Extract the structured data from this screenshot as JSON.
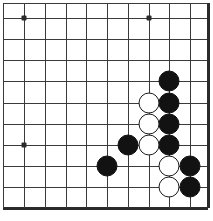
{
  "figure": {
    "kind": "go-board-diagram",
    "title": "",
    "caption": "",
    "corner": "bottom-left"
  },
  "board": {
    "background_color": "#ffffff",
    "line_color": "#3a3a3a",
    "edge_color": "#2b2b2b",
    "black_color": "#121212",
    "white_color": "#ffffff",
    "white_outline_color": "#1a1a1a",
    "spacing_px": 20.8,
    "stone_diameter_px": 21,
    "vertical_lines_x": [
      3,
      24,
      45,
      66,
      86,
      107,
      128,
      149,
      169,
      190,
      207
    ],
    "horizontal_lines_y": [
      3,
      18,
      39,
      60,
      81,
      103,
      124,
      145,
      166,
      187,
      207
    ],
    "edges": {
      "bottom_y": 207,
      "bottom_thickness": 3,
      "right_x": 207,
      "right_thickness": 3,
      "top_y": 3,
      "left_x": 3
    }
  },
  "star_points": [
    {
      "name": "star-point-upper-left",
      "x": 24,
      "y": 18
    },
    {
      "name": "star-point-upper-right",
      "x": 149,
      "y": 18
    },
    {
      "name": "star-point-lower-left",
      "x": 24,
      "y": 145
    }
  ],
  "stones": [
    {
      "color": "black",
      "x": 169,
      "y": 81
    },
    {
      "color": "black",
      "x": 169,
      "y": 103
    },
    {
      "color": "black",
      "x": 169,
      "y": 124
    },
    {
      "color": "black",
      "x": 169,
      "y": 145
    },
    {
      "color": "black",
      "x": 128,
      "y": 145
    },
    {
      "color": "black",
      "x": 107,
      "y": 166
    },
    {
      "color": "black",
      "x": 190,
      "y": 166
    },
    {
      "color": "black",
      "x": 190,
      "y": 187
    },
    {
      "color": "white",
      "x": 149,
      "y": 103
    },
    {
      "color": "white",
      "x": 149,
      "y": 124
    },
    {
      "color": "white",
      "x": 149,
      "y": 145
    },
    {
      "color": "white",
      "x": 169,
      "y": 166
    },
    {
      "color": "white",
      "x": 169,
      "y": 187
    }
  ],
  "counts": {
    "black_stones": 8,
    "white_stones": 5,
    "total_stones": 13
  }
}
